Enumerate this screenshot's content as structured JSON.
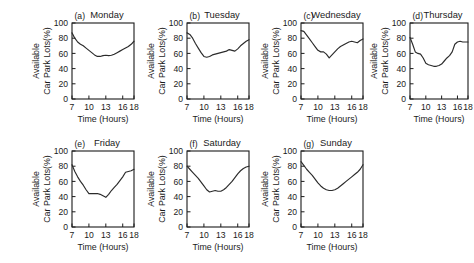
{
  "figure": {
    "layout": "7 panels: 4 in top row, 3 in bottom row",
    "background_color": "#ffffff",
    "line_color": "#2b2b2b",
    "axis_color": "#1b1b1b"
  },
  "chart_data": [
    {
      "type": "line",
      "tag": "(a)",
      "title": "Monday",
      "xlabel": "Time (Hours)",
      "ylabel_line1": "Available",
      "ylabel_line2": "Car Park Lots(%)",
      "xlim": [
        7,
        18
      ],
      "ylim": [
        0,
        100
      ],
      "xticks": [
        7,
        10,
        13,
        16,
        18
      ],
      "yticks": [
        0,
        20,
        40,
        60,
        80,
        100
      ],
      "grid": false,
      "legend": "none",
      "x": [
        7,
        7.5,
        8,
        8.5,
        9,
        9.5,
        10,
        10.5,
        11,
        11.5,
        12,
        12.5,
        13,
        13.5,
        14,
        14.5,
        15,
        15.5,
        16,
        16.5,
        17,
        17.5,
        18
      ],
      "values": [
        87,
        80,
        75,
        72,
        70,
        67,
        64,
        61,
        58,
        56,
        56,
        57,
        57.5,
        57,
        57.5,
        59,
        61,
        63,
        65,
        67,
        69,
        72,
        76
      ]
    },
    {
      "type": "line",
      "tag": "(b)",
      "title": "Tuesday",
      "xlabel": "Time (Hours)",
      "ylabel_line1": "Available",
      "ylabel_line2": "Car Park Lots(%)",
      "xlim": [
        7,
        18
      ],
      "ylim": [
        0,
        100
      ],
      "xticks": [
        7,
        10,
        13,
        16,
        18
      ],
      "yticks": [
        0,
        20,
        40,
        60,
        80,
        100
      ],
      "grid": false,
      "legend": "none",
      "x": [
        7,
        7.5,
        8,
        8.5,
        9,
        9.5,
        10,
        10.5,
        11,
        11.5,
        12,
        12.5,
        13,
        13.5,
        14,
        14.5,
        15,
        15.5,
        16,
        16.5,
        17,
        17.5,
        18
      ],
      "values": [
        87,
        85,
        80,
        73,
        67,
        61,
        56,
        55,
        56,
        58,
        59,
        60,
        61,
        62,
        63,
        65,
        64,
        63,
        66,
        70,
        73,
        76,
        78
      ]
    },
    {
      "type": "line",
      "tag": "(c)",
      "title": "Wednesday",
      "xlabel": "Time (Hours)",
      "ylabel_line1": "Available",
      "ylabel_line2": "Car Park Lots(%)",
      "xlim": [
        7,
        18
      ],
      "ylim": [
        0,
        100
      ],
      "xticks": [
        7,
        10,
        13,
        16,
        18
      ],
      "yticks": [
        0,
        20,
        40,
        60,
        80,
        100
      ],
      "grid": false,
      "legend": "none",
      "x": [
        7,
        7.5,
        8,
        8.5,
        9,
        9.5,
        10,
        10.5,
        11,
        11.5,
        12,
        12.5,
        13,
        13.5,
        14,
        14.5,
        15,
        15.5,
        16,
        16.5,
        17,
        17.5,
        18
      ],
      "values": [
        90,
        89,
        84,
        79,
        74,
        69,
        64,
        62,
        62,
        59,
        54,
        58,
        62,
        66,
        69,
        71,
        73,
        75,
        76,
        75,
        74,
        77,
        79
      ]
    },
    {
      "type": "line",
      "tag": "(d)",
      "title": "Thursday",
      "xlabel": "Time (Hours)",
      "ylabel_line1": "Available",
      "ylabel_line2": "Car Park Lots(%)",
      "xlim": [
        7,
        18
      ],
      "ylim": [
        0,
        100
      ],
      "xticks": [
        7,
        10,
        13,
        16,
        18
      ],
      "yticks": [
        0,
        20,
        40,
        60,
        80,
        100
      ],
      "grid": false,
      "legend": "none",
      "x": [
        7,
        7.5,
        8,
        8.5,
        9,
        9.5,
        10,
        10.5,
        11,
        11.5,
        12,
        12.5,
        13,
        13.5,
        14,
        14.5,
        15,
        15.5,
        16,
        16.5,
        17,
        17.5,
        18
      ],
      "values": [
        81,
        72,
        62,
        60,
        59,
        54,
        47,
        45,
        44,
        43,
        43,
        44,
        46,
        50,
        54,
        57,
        62,
        72,
        75,
        76,
        75,
        75,
        75
      ]
    },
    {
      "type": "line",
      "tag": "(e)",
      "title": "Friday",
      "xlabel": "Time (Hours)",
      "ylabel_line1": "Available",
      "ylabel_line2": "Car Park Lots(%)",
      "xlim": [
        7,
        18
      ],
      "ylim": [
        0,
        100
      ],
      "xticks": [
        7,
        10,
        13,
        16,
        18
      ],
      "yticks": [
        0,
        20,
        40,
        60,
        80,
        100
      ],
      "grid": false,
      "legend": "none",
      "x": [
        7,
        7.5,
        8,
        8.5,
        9,
        9.5,
        10,
        10.5,
        11,
        11.5,
        12,
        12.5,
        13,
        13.5,
        14,
        14.5,
        15,
        15.5,
        16,
        16.5,
        17,
        17.5,
        18
      ],
      "values": [
        82,
        73,
        66,
        60,
        55,
        49,
        44,
        44,
        44,
        44,
        43,
        41,
        39,
        43,
        48,
        52,
        56,
        61,
        66,
        72,
        73,
        74,
        76
      ]
    },
    {
      "type": "line",
      "tag": "(f)",
      "title": "Saturday",
      "xlabel": "Time (Hours)",
      "ylabel_line1": "Available",
      "ylabel_line2": "Car Park Lots(%)",
      "xlim": [
        7,
        18
      ],
      "ylim": [
        0,
        100
      ],
      "xticks": [
        7,
        10,
        13,
        16,
        18
      ],
      "yticks": [
        0,
        20,
        40,
        60,
        80,
        100
      ],
      "grid": false,
      "legend": "none",
      "x": [
        7,
        7.5,
        8,
        8.5,
        9,
        9.5,
        10,
        10.5,
        11,
        11.5,
        12,
        12.5,
        13,
        13.5,
        14,
        14.5,
        15,
        15.5,
        16,
        16.5,
        17,
        17.5,
        18
      ],
      "values": [
        80,
        76,
        72,
        68,
        64,
        59,
        54,
        49,
        46,
        47,
        48,
        47,
        47,
        49,
        52,
        56,
        60,
        65,
        70,
        74,
        77,
        79,
        80
      ]
    },
    {
      "type": "line",
      "tag": "(g)",
      "title": "Sunday",
      "xlabel": "Time (Hours)",
      "ylabel_line1": "Available",
      "ylabel_line2": "Car Park Lots(%)",
      "xlim": [
        7,
        18
      ],
      "ylim": [
        0,
        100
      ],
      "xticks": [
        7,
        10,
        13,
        16,
        18
      ],
      "yticks": [
        0,
        20,
        40,
        60,
        80,
        100
      ],
      "grid": false,
      "legend": "none",
      "x": [
        7,
        7.5,
        8,
        8.5,
        9,
        9.5,
        10,
        10.5,
        11,
        11.5,
        12,
        12.5,
        13,
        13.5,
        14,
        14.5,
        15,
        15.5,
        16,
        16.5,
        17,
        17.5,
        18
      ],
      "values": [
        86,
        81,
        76,
        72,
        68,
        63,
        58,
        54,
        51,
        49,
        48,
        48,
        49,
        51,
        54,
        57,
        60,
        63,
        66,
        69,
        72,
        76,
        82
      ]
    }
  ],
  "panel_positions": [
    {
      "left": 28,
      "top": 6,
      "width": 112,
      "height": 126
    },
    {
      "left": 143,
      "top": 6,
      "width": 112,
      "height": 126
    },
    {
      "left": 257,
      "top": 6,
      "width": 112,
      "height": 126
    },
    {
      "left": 366,
      "top": 6,
      "width": 108,
      "height": 126
    },
    {
      "left": 28,
      "top": 134,
      "width": 112,
      "height": 126
    },
    {
      "left": 143,
      "top": 134,
      "width": 112,
      "height": 126
    },
    {
      "left": 257,
      "top": 134,
      "width": 112,
      "height": 126
    }
  ]
}
